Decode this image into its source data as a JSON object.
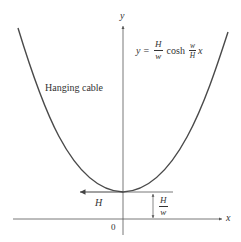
{
  "figure": {
    "curve_label": "Hanging cable",
    "equation": {
      "lhs": "y",
      "equals": "=",
      "coef_num": "H",
      "coef_den": "w",
      "func": "cosh",
      "arg_num": "w",
      "arg_den": "H",
      "var": "x"
    },
    "axes": {
      "x_label": "x",
      "y_label": "y",
      "origin_label": "0"
    },
    "tension_label": "H",
    "height_marker": {
      "num": "H",
      "den": "w"
    }
  },
  "colors": {
    "curve": "#4a4a4a",
    "axes": "#555555",
    "text": "#333333",
    "background": "#ffffff"
  }
}
